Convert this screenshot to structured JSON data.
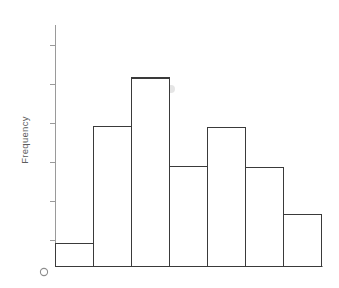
{
  "chart_data": {
    "type": "bar",
    "title": "",
    "subtitle": "",
    "xlabel": "",
    "ylabel": "Frequency",
    "categories": [
      "1",
      "2",
      "3",
      "4",
      "5",
      "6",
      "7"
    ],
    "values": [
      23,
      140,
      188,
      100,
      139,
      99,
      52
    ],
    "ylim": [
      0,
      241
    ],
    "xlim": [
      0,
      7
    ],
    "grid": false,
    "legend": null,
    "legend_position": "none",
    "y_tick_count": 6,
    "y_tick_labels": [
      "",
      "",
      "",
      "",
      "",
      ""
    ],
    "x_tick_labels": [
      "",
      "",
      "",
      "",
      "",
      "",
      ""
    ],
    "annotations": [
      "O"
    ],
    "bar_fill": "#ffffff",
    "bar_stroke": "#3a3a3a",
    "axis_color": "#9a9a9a"
  },
  "axes": {
    "y_axis_title": "Frequency",
    "origin_marker": "O"
  },
  "icons": {
    "origin_circle": "circle-icon"
  }
}
